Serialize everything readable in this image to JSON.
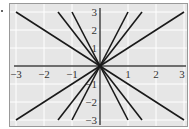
{
  "chart_data": {
    "type": "line",
    "title": "",
    "xlabel": "",
    "ylabel": "",
    "xlim": [
      -3,
      3
    ],
    "ylim": [
      -3,
      3
    ],
    "grid": true,
    "x_ticks": [
      "-3",
      "-2",
      "-1",
      "1",
      "2",
      "3"
    ],
    "y_ticks": [
      "3",
      "2",
      "1",
      "-1",
      "-2",
      "-3"
    ],
    "series": [
      {
        "name": "y = x",
        "points": [
          [
            -3,
            -3
          ],
          [
            3,
            3
          ]
        ]
      },
      {
        "name": "y = -x",
        "points": [
          [
            -3,
            3
          ],
          [
            3,
            -3
          ]
        ]
      },
      {
        "name": "y = 2x",
        "points": [
          [
            -1.5,
            -3
          ],
          [
            1.5,
            3
          ]
        ]
      },
      {
        "name": "y = -2x",
        "points": [
          [
            -1.5,
            3
          ],
          [
            1.5,
            -3
          ]
        ]
      },
      {
        "name": "y = 3x",
        "points": [
          [
            -1,
            -3
          ],
          [
            1,
            3
          ]
        ]
      },
      {
        "name": "y = -3x",
        "points": [
          [
            -1,
            3
          ],
          [
            1,
            -3
          ]
        ]
      }
    ],
    "colors": {
      "background": "#e6e6e6",
      "grid": "#ffffff",
      "lines": "#1a1a1a",
      "axes": "#444444",
      "frame": "#999999"
    }
  }
}
